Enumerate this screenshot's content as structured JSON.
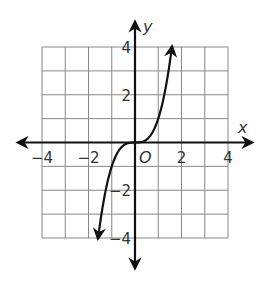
{
  "chart_data": {
    "type": "line",
    "title": "",
    "xlabel": "x",
    "ylabel": "y",
    "origin_label": "O",
    "xlim": [
      -4,
      4
    ],
    "ylim": [
      -4,
      4
    ],
    "grid": true,
    "grid_step": 1,
    "x_ticks": [
      -4,
      -2,
      2,
      4
    ],
    "y_ticks": [
      4,
      2,
      -2,
      -4
    ],
    "x_tick_labels": [
      "−4",
      "−2",
      "2",
      "4"
    ],
    "y_tick_labels": [
      "4",
      "2",
      "−2",
      "−4"
    ],
    "series": [
      {
        "name": "y = x^3",
        "function": "x^3",
        "arrows": "both-ends",
        "x": [
          -1.59,
          -1.5,
          -1.25,
          -1.0,
          -0.75,
          -0.5,
          -0.25,
          0,
          0.25,
          0.5,
          0.75,
          1.0,
          1.25,
          1.5,
          1.59
        ],
        "y": [
          -4.0,
          -3.375,
          -1.953,
          -1.0,
          -0.422,
          -0.125,
          -0.016,
          0,
          0.016,
          0.125,
          0.422,
          1.0,
          1.953,
          3.375,
          4.0
        ]
      }
    ],
    "colors": {
      "curve": "#111111",
      "axes": "#111111",
      "grid": "#888888"
    }
  }
}
